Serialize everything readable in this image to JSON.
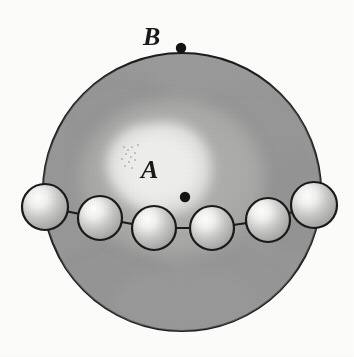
{
  "figure": {
    "background_color": "#fdfdfc",
    "canvas": {
      "width": 354,
      "height": 357
    },
    "labels": [
      {
        "id": "B",
        "text": "B",
        "x": 143,
        "y": 24,
        "font_size": 26,
        "style": "italic-serif",
        "color": "#181818"
      },
      {
        "id": "A",
        "text": "A",
        "x": 141,
        "y": 157,
        "font_size": 26,
        "style": "italic-serif",
        "color": "#181818"
      }
    ],
    "big_circle": {
      "name": "outer-sphere",
      "cx": 182,
      "cy": 192,
      "r": 140,
      "fill": "#9b9b9b",
      "stroke": "#1d1d1d",
      "stroke_width": 2.2
    },
    "inner_halo": {
      "name": "inner-halo-region",
      "cx": 172,
      "cy": 178,
      "rx": 92,
      "ry": 78,
      "fill": "#adadad"
    },
    "inner_blob": {
      "name": "bright-core-blob",
      "cx": 160,
      "cy": 172,
      "rx": 56,
      "ry": 50,
      "fill": "#e4e4e2"
    },
    "dots": [
      {
        "id": "dot-B",
        "label_for": "B",
        "cx": 181,
        "cy": 48,
        "r": 5.2,
        "color": "#141414"
      },
      {
        "id": "dot-A",
        "label_for": "A",
        "cx": 185,
        "cy": 197,
        "r": 5.2,
        "color": "#141414"
      }
    ],
    "spheres": {
      "count": 6,
      "fill": "#b4b4b4",
      "highlight_color": "#f2f2f0",
      "stroke": "#1b1b1b",
      "stroke_width": 2.2,
      "items": [
        {
          "index": 1,
          "cx": 45,
          "cy": 207,
          "r": 23
        },
        {
          "index": 2,
          "cx": 100,
          "cy": 218,
          "r": 22
        },
        {
          "index": 3,
          "cx": 154,
          "cy": 228,
          "r": 22
        },
        {
          "index": 4,
          "cx": 212,
          "cy": 228,
          "r": 22
        },
        {
          "index": 5,
          "cx": 268,
          "cy": 220,
          "r": 22
        },
        {
          "index": 6,
          "cx": 314,
          "cy": 205,
          "r": 23
        }
      ]
    },
    "connectors": {
      "name": "sphere-chain-links",
      "stroke": "#1b1b1b",
      "stroke_width": 2.0,
      "segments": [
        {
          "from": 1,
          "to": 2
        },
        {
          "from": 2,
          "to": 3
        },
        {
          "from": 3,
          "to": 4
        },
        {
          "from": 4,
          "to": 5
        },
        {
          "from": 5,
          "to": 6
        }
      ]
    }
  }
}
